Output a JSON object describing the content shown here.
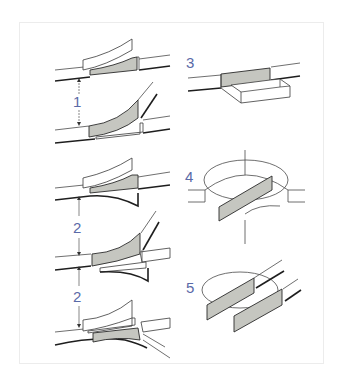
{
  "figure": {
    "labels": [
      {
        "id": "1",
        "text": "1"
      },
      {
        "id": "2a",
        "text": "2"
      },
      {
        "id": "2b",
        "text": "2"
      },
      {
        "id": "3",
        "text": "3"
      },
      {
        "id": "4",
        "text": "4"
      },
      {
        "id": "5",
        "text": "5"
      }
    ]
  },
  "colors": {
    "label": "#5a6aa8",
    "shade": "#c5c6c0",
    "line": "#1e1e1e",
    "background": "#ffffff"
  }
}
